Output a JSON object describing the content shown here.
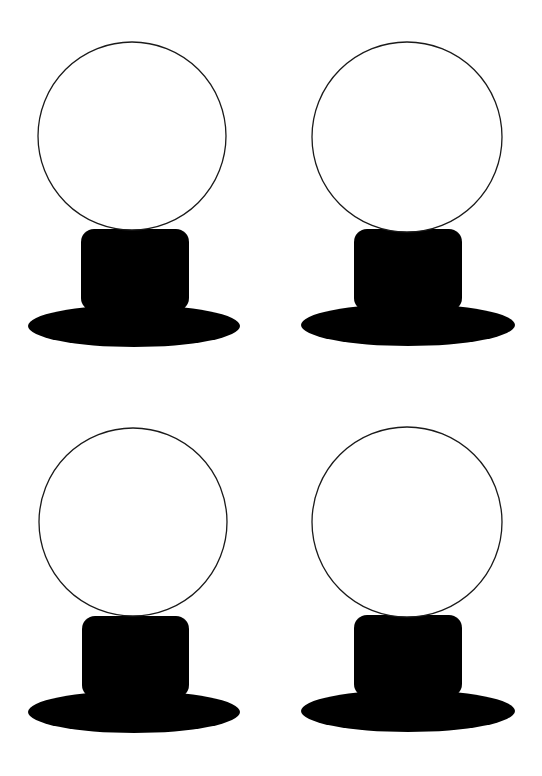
{
  "page": {
    "background": "#ffffff"
  },
  "figures": [
    {
      "id": "figure-top-left",
      "parts": [
        "globe",
        "neck",
        "base"
      ],
      "globe_fill": "#ffffff",
      "globe_stroke": "#1a1a1a",
      "neck_fill": "#000000",
      "base_fill": "#000000"
    },
    {
      "id": "figure-top-right",
      "parts": [
        "globe",
        "neck",
        "base"
      ],
      "globe_fill": "#ffffff",
      "globe_stroke": "#1a1a1a",
      "neck_fill": "#000000",
      "base_fill": "#000000"
    },
    {
      "id": "figure-bottom-left",
      "parts": [
        "globe",
        "neck",
        "base"
      ],
      "globe_fill": "#ffffff",
      "globe_stroke": "#1a1a1a",
      "neck_fill": "#000000",
      "base_fill": "#000000"
    },
    {
      "id": "figure-bottom-right",
      "parts": [
        "globe",
        "neck",
        "base"
      ],
      "globe_fill": "#ffffff",
      "globe_stroke": "#1a1a1a",
      "neck_fill": "#000000",
      "base_fill": "#000000"
    }
  ]
}
